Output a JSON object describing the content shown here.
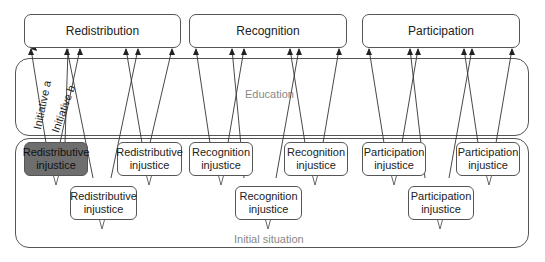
{
  "top_boxes": [
    {
      "label": "Redistribution"
    },
    {
      "label": "Recognition"
    },
    {
      "label": "Participation"
    }
  ],
  "bands": {
    "education": "Education",
    "initial_situation": "Initial situation"
  },
  "initiatives": {
    "a": "Initiative a",
    "b": "Initiative b"
  },
  "injustices": [
    {
      "label": "Redistributive injustice",
      "highlighted": true
    },
    {
      "label": "Redistributive injustice",
      "highlighted": false
    },
    {
      "label": "Redistributive injustice",
      "highlighted": false
    },
    {
      "label": "Recognition injustice",
      "highlighted": false
    },
    {
      "label": "Recognition injustice",
      "highlighted": false
    },
    {
      "label": "Recognition injustice",
      "highlighted": false
    },
    {
      "label": "Participation injustice",
      "highlighted": false
    },
    {
      "label": "Participation injustice",
      "highlighted": false
    },
    {
      "label": "Participation injustice",
      "highlighted": false
    }
  ],
  "colors": {
    "highlight": "#6e6e6e",
    "border": "#555555",
    "band_label": "#888888"
  }
}
